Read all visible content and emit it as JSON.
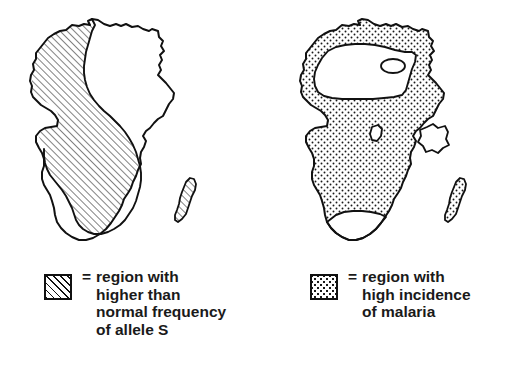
{
  "figure": {
    "background_color": "#ffffff",
    "ink_color": "#111111",
    "panels": [
      {
        "id": "allele-s",
        "map_name": "africa-map-allele-s",
        "fill_pattern": "diagonal-hatch",
        "legend": {
          "equals_sign": "=",
          "swatch_pattern": "diagonal-hatch",
          "lines": [
            "region with",
            "higher than",
            "normal frequency",
            "of allele S"
          ]
        }
      },
      {
        "id": "malaria",
        "map_name": "africa-map-malaria",
        "fill_pattern": "stipple-dots",
        "legend": {
          "equals_sign": "=",
          "swatch_pattern": "stipple-dots",
          "lines": [
            "region with",
            "high incidence",
            "of malaria"
          ]
        }
      }
    ]
  }
}
